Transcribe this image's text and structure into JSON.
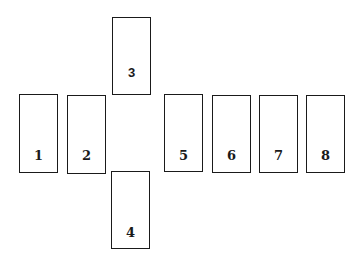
{
  "diagram": {
    "cards": [
      {
        "label": "1"
      },
      {
        "label": "2"
      },
      {
        "label": "3"
      },
      {
        "label": "4"
      },
      {
        "label": "5"
      },
      {
        "label": "6"
      },
      {
        "label": "7"
      },
      {
        "label": "8"
      }
    ]
  }
}
